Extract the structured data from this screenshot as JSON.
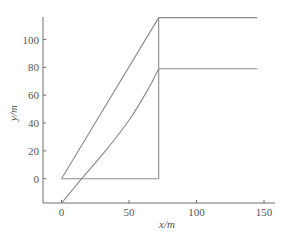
{
  "chart_data": {
    "type": "line",
    "title": "",
    "xlabel": "x/m",
    "ylabel": "y/m",
    "xlim": [
      -13,
      157
    ],
    "ylim": [
      -17.5,
      117
    ],
    "xticks": [
      0,
      50,
      100,
      150
    ],
    "yticks": [
      0,
      20,
      40,
      60,
      80,
      100
    ],
    "xtick_labels": [
      "0",
      "50",
      "100",
      "150"
    ],
    "ytick_labels": [
      "0",
      "20",
      "40",
      "60",
      "80",
      "100"
    ],
    "grid": false,
    "legend": null,
    "series": [
      {
        "name": "upper-trajectory",
        "x": [
          0,
          72,
          145
        ],
        "y": [
          0,
          115.7,
          115.7
        ]
      },
      {
        "name": "base-line",
        "x": [
          0,
          72
        ],
        "y": [
          0,
          0
        ]
      },
      {
        "name": "vertical-line",
        "x": [
          72,
          72
        ],
        "y": [
          0,
          115.7
        ]
      },
      {
        "name": "lower-curve",
        "x": [
          0,
          15,
          33,
          50,
          64,
          72,
          145
        ],
        "y": [
          -17.5,
          0,
          20.5,
          42,
          64,
          79,
          79
        ]
      }
    ],
    "colors": {
      "axis": "#6e6e6e",
      "line": "#8a8a8a",
      "text": "#555555"
    }
  }
}
